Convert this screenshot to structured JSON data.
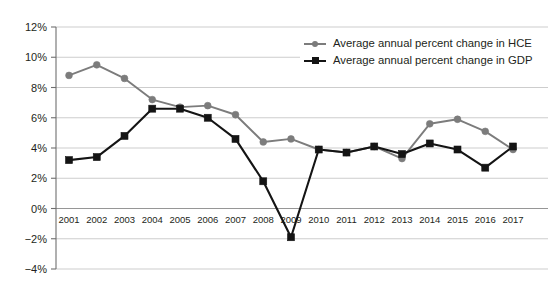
{
  "chart_data": {
    "type": "line",
    "title": "",
    "subtitle": "",
    "xlabel": "",
    "ylabel": "",
    "x": [
      2001,
      2002,
      2003,
      2004,
      2005,
      2006,
      2007,
      2008,
      2009,
      2010,
      2011,
      2012,
      2013,
      2014,
      2015,
      2016,
      2017
    ],
    "categories": [
      "2001",
      "2002",
      "2003",
      "2004",
      "2005",
      "2006",
      "2007",
      "2008",
      "2009",
      "2010",
      "2011",
      "2012",
      "2013",
      "2014",
      "2015",
      "2016",
      "2017"
    ],
    "series": [
      {
        "name": "Average annual percent change in HCE",
        "color": "#7c7c7c",
        "marker": "circle",
        "values": [
          8.8,
          9.5,
          8.6,
          7.2,
          6.7,
          6.8,
          6.2,
          4.4,
          4.6,
          3.9,
          3.7,
          4.1,
          3.3,
          5.6,
          5.9,
          5.1,
          3.9
        ]
      },
      {
        "name": "Average annual percent change in GDP",
        "color": "#141414",
        "marker": "square",
        "values": [
          3.2,
          3.4,
          4.8,
          6.6,
          6.6,
          6.0,
          4.6,
          1.8,
          -1.9,
          3.9,
          3.7,
          4.1,
          3.6,
          4.3,
          3.9,
          2.7,
          4.1
        ]
      }
    ],
    "ylim": [
      -4,
      12
    ],
    "yticks": [
      12,
      10,
      8,
      6,
      4,
      2,
      0,
      -2,
      -4
    ],
    "ytick_labels": [
      "12%",
      "10%",
      "8%",
      "6%",
      "4%",
      "2%",
      "0%",
      "−2%",
      "−4%"
    ],
    "grid": true,
    "grid_axis": "y",
    "legend_position": "top-right",
    "legend": [
      "Average annual percent change in HCE",
      "Average annual percent change in GDP"
    ]
  },
  "colors": {
    "hce": "#7c7c7c",
    "gdp": "#141414",
    "gridline": "#b8b8b8",
    "axis": "#6f6f6f",
    "text": "#231f20",
    "background": "#ffffff"
  }
}
